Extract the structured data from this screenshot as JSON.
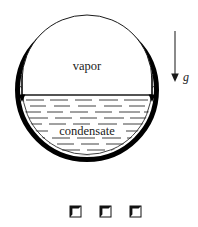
{
  "figure": {
    "background_color": "#ffffff",
    "ink_color": "#000000",
    "labels": {
      "vapor": "vapor",
      "condensate": "condensate",
      "gravity": "g"
    },
    "vessel": {
      "name": "tube-wall-circle",
      "center_x": 87,
      "center_y": 90,
      "outer_radius": 72,
      "wall_thickness": 5,
      "film_radius": 66,
      "film_color": "#000000"
    },
    "interface": {
      "name": "vapor-condensate-interface",
      "y": 95,
      "x_start": 22,
      "x_end": 152
    },
    "vapor_region": {
      "name": "vapor-dome",
      "label_x": 87,
      "label_y": 66
    },
    "condensate_region": {
      "name": "condensate-pool",
      "label_x": 87,
      "label_y": 131,
      "hatch_line_color": "#2b2b2b",
      "hatch_rows": 11
    },
    "gravity_arrow": {
      "name": "gravity-vector",
      "x": 175,
      "y_start": 31,
      "y_end": 81,
      "label_x": 185,
      "label_y": 79
    },
    "film_arrows": {
      "count_per_side": 7,
      "left_drain_x": 22,
      "right_drain_x": 152,
      "drain_y_start": 78,
      "drain_y_end": 99
    },
    "bottom_squares": {
      "name": "page-footer-marks",
      "count": 3,
      "y": 206,
      "size": 11,
      "x_positions": [
        70,
        100,
        130
      ],
      "border_color": "#111111"
    }
  }
}
